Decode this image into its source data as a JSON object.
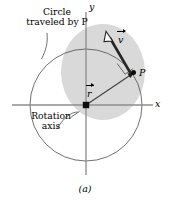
{
  "figure": {
    "caption": "(a)"
  },
  "axes": {
    "x_label": "x",
    "y_label": "y",
    "origin_marker": "filled-square",
    "axis_color": "#8c8c8c"
  },
  "annotations": {
    "circle_label_line1": "Circle",
    "circle_label_line2": "traveled by P",
    "circle_label_full": "Circle traveled by P",
    "rotation_label_line1": "Rotation",
    "rotation_label_line2": "axis",
    "rotation_label_full": "Rotation axis",
    "point_label": "P"
  },
  "vectors": {
    "position": {
      "symbol": "r",
      "label": "r",
      "accent": "arrow-overhead",
      "from": "origin",
      "to": "P"
    },
    "velocity": {
      "symbol": "v",
      "label": "v",
      "accent": "arrow-overhead",
      "from": "P",
      "direction": "tangent, perpendicular to r",
      "arrowhead": "hollow"
    }
  },
  "markers": {
    "right_angle": "square corner between r and v"
  },
  "colors": {
    "body_fill": "#d9d9d9",
    "circle_stroke": "#4d4d4d",
    "axis": "#8c8c8c",
    "vector": "#1a1a1a",
    "background": "#ffffff"
  }
}
